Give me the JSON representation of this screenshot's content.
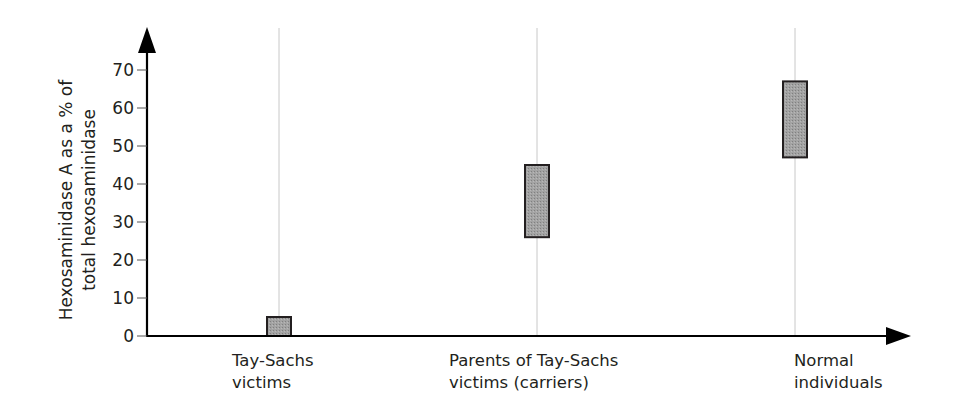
{
  "chart_data": {
    "type": "range-bar",
    "title": "",
    "xlabel": "",
    "ylabel": "Hexosaminidase A as a % of total hexosaminidase",
    "ylabel_lines": [
      "Hexosaminidase A as a % of",
      "total hexosaminidase"
    ],
    "ylim": [
      0,
      70
    ],
    "yticks": [
      0,
      10,
      20,
      30,
      40,
      50,
      60,
      70
    ],
    "grid": false,
    "legend": null,
    "categories": [
      {
        "label_lines": [
          "Tay-Sachs",
          "victims"
        ],
        "low": 0,
        "high": 5
      },
      {
        "label_lines": [
          "Parents of Tay-Sachs",
          "victims (carriers)"
        ],
        "low": 26,
        "high": 45
      },
      {
        "label_lines": [
          "Normal",
          "individuals"
        ],
        "low": 47,
        "high": 67
      }
    ],
    "colors": {
      "bar_fill": "#9b9b9b",
      "bar_stroke": "#231f20",
      "axis": "#000000",
      "guide_line": "#c8c8c8"
    }
  }
}
